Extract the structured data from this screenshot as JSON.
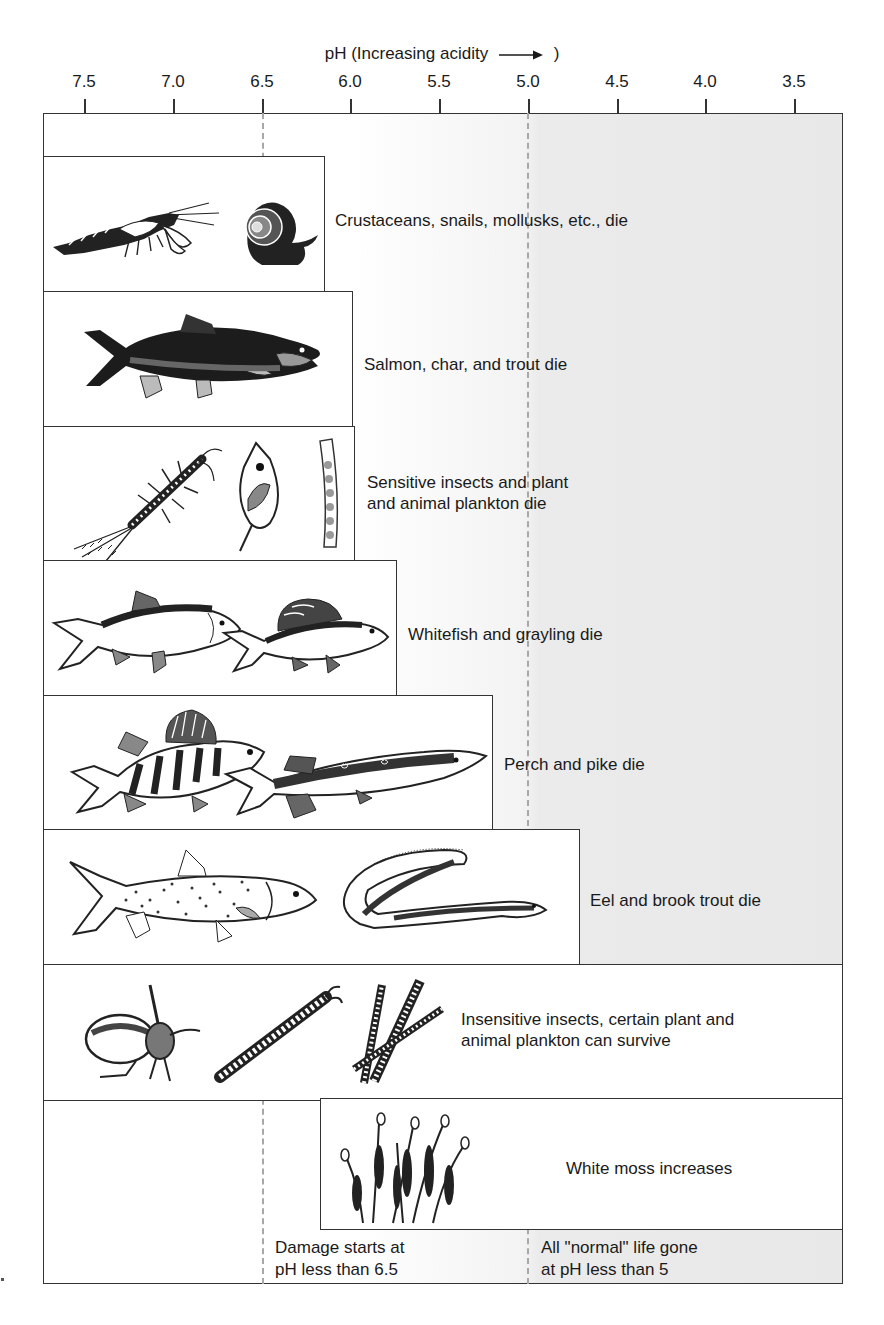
{
  "axis": {
    "title": "pH (Increasing acidity",
    "title_close": ")",
    "ticks": [
      "7.5",
      "7.0",
      "6.5",
      "6.0",
      "5.5",
      "5.0",
      "4.5",
      "4.0",
      "3.5"
    ],
    "direction_icon": "right-arrow-icon"
  },
  "thresholds": [
    {
      "ph": "6.5",
      "style": "dashed"
    },
    {
      "ph": "5.0",
      "style": "dashed"
    }
  ],
  "rows": [
    {
      "label": "Crustaceans, snails, mollusks, etc., die",
      "ph_limit": 6.15,
      "icons": [
        "crayfish-icon",
        "snail-icon"
      ]
    },
    {
      "label": "Salmon, char, and trout die",
      "ph_limit": 6.0,
      "icons": [
        "salmon-icon"
      ]
    },
    {
      "label_line1": "Sensitive insects and plant",
      "label_line2": "and animal plankton die",
      "ph_limit": 6.0,
      "icons": [
        "mayfly-nymph-icon",
        "daphnia-icon",
        "algae-filament-icon"
      ]
    },
    {
      "label": "Whitefish and grayling die",
      "ph_limit": 5.75,
      "icons": [
        "whitefish-icon",
        "grayling-icon"
      ]
    },
    {
      "label": "Perch and pike die",
      "ph_limit": 5.2,
      "icons": [
        "perch-icon",
        "pike-icon"
      ]
    },
    {
      "label": "Eel and brook trout die",
      "ph_limit": 4.7,
      "icons": [
        "brook-trout-icon",
        "eel-icon"
      ]
    },
    {
      "label_line1": "Insensitive insects, certain plant and",
      "label_line2": "animal plankton can survive",
      "ph_limit": 3.3,
      "icons": [
        "water-beetle-icon",
        "larva-icon",
        "plankton-filaments-icon"
      ]
    },
    {
      "label": "White moss increases",
      "ph_start": 6.2,
      "icons": [
        "white-moss-icon"
      ]
    }
  ],
  "notes": {
    "damage_line1": "Damage starts at",
    "damage_line2": "pH less than 6.5",
    "gone_line1": "All \"normal\" life gone",
    "gone_line2": "at pH less than 5"
  },
  "colors": {
    "frame": "#333333",
    "acidic_shade": "#e8e8e8",
    "dash": "#a8a8a8"
  }
}
